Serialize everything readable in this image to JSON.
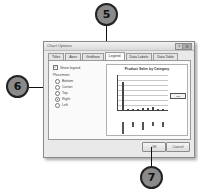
{
  "dialog": {
    "title": "Chart Options",
    "help_button": "?",
    "close_button": "X",
    "tabs": [
      {
        "label": "Titles",
        "active": false
      },
      {
        "label": "Axes",
        "active": false
      },
      {
        "label": "Gridlines",
        "active": false
      },
      {
        "label": "Legend",
        "active": true
      },
      {
        "label": "Data Labels",
        "active": false
      },
      {
        "label": "Data Table",
        "active": false
      }
    ],
    "show_legend": {
      "label": "Show legend",
      "checked": true
    },
    "placement": {
      "label": "Placement",
      "options": [
        {
          "label": "Bottom",
          "selected": false
        },
        {
          "label": "Corner",
          "selected": false
        },
        {
          "label": "Top",
          "selected": false
        },
        {
          "label": "Right",
          "selected": true
        },
        {
          "label": "Left",
          "selected": false
        }
      ]
    },
    "preview": {
      "chart_title": "Product Sales by Category",
      "legend_label": "Total"
    },
    "buttons": {
      "ok": "OK",
      "cancel": "Cancel"
    }
  },
  "callouts": {
    "c5": "5",
    "c6": "6",
    "c7": "7"
  }
}
